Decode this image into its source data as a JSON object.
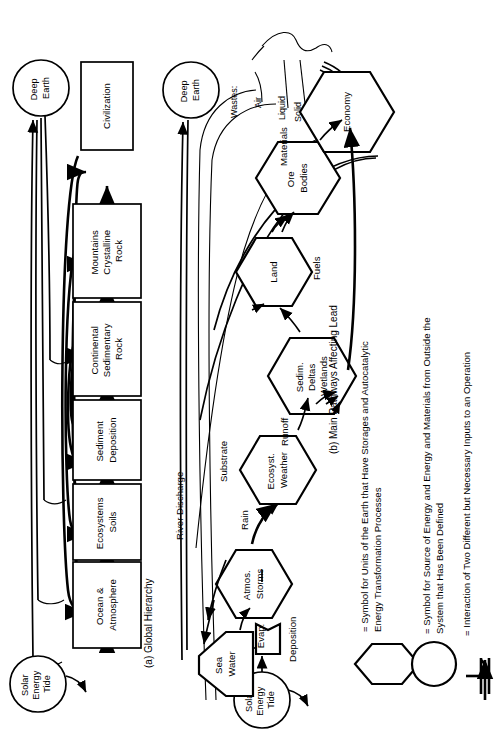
{
  "figure": {
    "orientation": "rotated-90-ccw",
    "background": "#ffffff",
    "ink": "#000000"
  },
  "panel_a": {
    "caption": "(a)  Global Hierarchy",
    "source_label": "Solar\nEnergy\nTide",
    "source_lines": [
      "Solar",
      "Energy",
      "Tide"
    ],
    "sink_label": "Deep\nEarth",
    "sink_lines": [
      "Deep",
      "Earth"
    ],
    "boxes": [
      {
        "id": "ocean",
        "lines": [
          "Ocean &",
          "Atmosphere"
        ]
      },
      {
        "id": "ecosystems",
        "lines": [
          "Ecosystems",
          "Soils"
        ]
      },
      {
        "id": "sediment",
        "lines": [
          "Sediment",
          "Deposition"
        ]
      },
      {
        "id": "continental",
        "lines": [
          "Continental",
          "Sedimentary",
          "Rock"
        ]
      },
      {
        "id": "mountains",
        "lines": [
          "Mountains",
          "Crystalline",
          "Rock"
        ]
      },
      {
        "id": "civilization",
        "lines": [
          "Civilization"
        ]
      }
    ]
  },
  "panel_b": {
    "caption": "(b) Main Pathways Affecting Lead",
    "sink_lines": [
      "Deep",
      "Earth"
    ],
    "source_lines": [
      "Solar",
      "Energy",
      "Tide"
    ],
    "tank_lines": [
      "Sea",
      "Water"
    ],
    "interaction_label": "Evap.",
    "hexes": [
      {
        "id": "atmos",
        "lines": [
          "Atmos.",
          "Storms"
        ]
      },
      {
        "id": "ecosyst",
        "lines": [
          "Ecosyst.",
          "Weather"
        ]
      },
      {
        "id": "sedim",
        "lines": [
          "Sedim.",
          "Deltas",
          "Wetlands"
        ]
      },
      {
        "id": "land",
        "lines": [
          "Land"
        ]
      },
      {
        "id": "ore",
        "lines": [
          "Ore",
          "Bodies"
        ]
      },
      {
        "id": "economy",
        "lines": [
          "Economy"
        ]
      }
    ],
    "pathway_labels": [
      {
        "id": "river-discharge",
        "text": "River Discharge"
      },
      {
        "id": "substrate",
        "text": "Substrate"
      },
      {
        "id": "rain",
        "text": "Rain"
      },
      {
        "id": "runoff",
        "text": "Runoff"
      },
      {
        "id": "deposition",
        "text": "Deposition"
      },
      {
        "id": "fuels",
        "text": "Fuels"
      },
      {
        "id": "materials",
        "text": "Materials"
      }
    ],
    "wastes": {
      "title": "Wastes:",
      "items": [
        "Air",
        "Liquid",
        "Solid"
      ]
    }
  },
  "legend": {
    "items": [
      {
        "id": "hexagon",
        "symbol": "hexagon-symbol",
        "lines": [
          "= Symbol for  Units of the Earth that Have Storages and Autocatalytic",
          "Energy Transformation  Processes"
        ]
      },
      {
        "id": "circle",
        "symbol": "circle-symbol",
        "lines": [
          "= Symbol for Source of Energy and Energy and Materials from Outside the",
          "System that Has Been Defined"
        ]
      },
      {
        "id": "interaction",
        "symbol": "interaction-symbol",
        "lines": [
          "= Interaction of Two Different but Necessary Inputs to an Operation"
        ]
      }
    ]
  }
}
